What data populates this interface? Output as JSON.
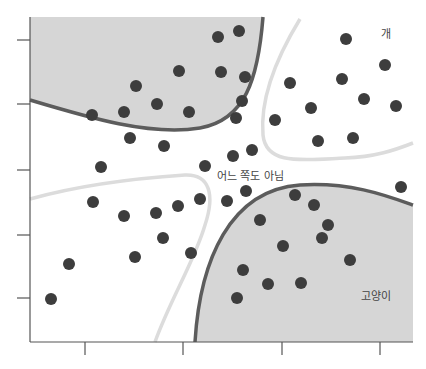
{
  "diagram": {
    "labels": {
      "dog": "개",
      "cat": "고양이",
      "neither": "어느 쪽도 아님"
    },
    "colors": {
      "region_fill": "#d6d6d6",
      "boundary_dark": "#5c5c5c",
      "boundary_light": "#dcdcdc",
      "dot": "#3d3d3d",
      "axis": "#555555",
      "background": "#ffffff"
    },
    "axes": {
      "y_ticks": [
        40,
        104,
        170,
        235,
        298
      ],
      "x_ticks": [
        85,
        183,
        282,
        380
      ]
    },
    "points": {
      "dog_like_gray_top_left": [
        [
          218,
          37
        ],
        [
          239,
          31
        ],
        [
          136,
          86
        ],
        [
          179,
          71
        ],
        [
          221,
          72
        ],
        [
          245,
          77
        ],
        [
          92,
          115
        ],
        [
          124,
          112
        ],
        [
          157,
          104
        ],
        [
          189,
          112
        ],
        [
          242,
          101
        ],
        [
          130,
          138
        ],
        [
          164,
          146
        ],
        [
          236,
          118
        ]
      ],
      "dog_region_top_right": [
        [
          346,
          39
        ],
        [
          385,
          65
        ],
        [
          290,
          83
        ],
        [
          342,
          79
        ],
        [
          364,
          99
        ],
        [
          396,
          106
        ],
        [
          311,
          108
        ],
        [
          275,
          120
        ],
        [
          318,
          141
        ],
        [
          353,
          138
        ]
      ],
      "neither_middle": [
        [
          101,
          167
        ],
        [
          205,
          166
        ],
        [
          233,
          156
        ],
        [
          252,
          150
        ],
        [
          246,
          191
        ],
        [
          401,
          187
        ]
      ],
      "bottom_left": [
        [
          93,
          202
        ],
        [
          124,
          216
        ],
        [
          156,
          213
        ],
        [
          178,
          206
        ],
        [
          200,
          199
        ],
        [
          227,
          201
        ],
        [
          163,
          238
        ],
        [
          135,
          257
        ],
        [
          191,
          253
        ],
        [
          69,
          264
        ],
        [
          51,
          299
        ]
      ],
      "cat_region_bottom_right": [
        [
          295,
          195
        ],
        [
          314,
          205
        ],
        [
          260,
          220
        ],
        [
          328,
          225
        ],
        [
          322,
          238
        ],
        [
          283,
          246
        ],
        [
          350,
          260
        ],
        [
          243,
          270
        ],
        [
          268,
          284
        ],
        [
          301,
          283
        ],
        [
          237,
          298
        ]
      ]
    }
  }
}
